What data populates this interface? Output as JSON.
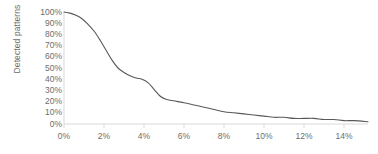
{
  "chart_data": {
    "type": "line",
    "title": "",
    "xlabel": "",
    "ylabel": "Detected patterns",
    "xlim": [
      0,
      15.2
    ],
    "ylim": [
      0,
      100
    ],
    "grid": false,
    "legend": null,
    "x_tick_labels": [
      "0%",
      "2%",
      "4%",
      "6%",
      "8%",
      "10%",
      "12%",
      "14%"
    ],
    "x_tick_values": [
      0,
      2,
      4,
      6,
      8,
      10,
      12,
      14
    ],
    "y_tick_labels": [
      "100%",
      "90%",
      "80%",
      "70%",
      "60%",
      "50%",
      "40%",
      "30%",
      "20%",
      "10%",
      "0%"
    ],
    "y_tick_values": [
      100,
      90,
      80,
      70,
      60,
      50,
      40,
      30,
      20,
      10,
      0
    ],
    "line_color": "#595959",
    "axis_color": "#d9d9d9",
    "tick_label_color": "#6d6d6d",
    "series": [
      {
        "name": "Detected patterns",
        "x": [
          0.0,
          0.3,
          0.6,
          0.9,
          1.2,
          1.5,
          1.8,
          2.1,
          2.4,
          2.7,
          3.0,
          3.3,
          3.6,
          3.9,
          4.2,
          4.5,
          4.8,
          5.1,
          5.4,
          5.7,
          6.0,
          6.5,
          7.0,
          7.5,
          8.0,
          8.5,
          9.0,
          9.5,
          10.0,
          10.5,
          11.0,
          11.5,
          12.0,
          12.5,
          13.0,
          13.5,
          14.0,
          14.5,
          15.2
        ],
        "y": [
          100,
          99,
          97,
          94,
          89,
          83,
          75,
          66,
          57,
          50,
          46,
          43,
          41,
          40,
          37,
          31,
          25,
          22,
          21,
          20,
          19,
          17,
          15,
          13,
          11,
          10,
          9,
          8,
          7,
          6,
          6,
          5,
          5,
          5,
          4,
          4,
          3,
          3,
          2
        ]
      }
    ]
  }
}
